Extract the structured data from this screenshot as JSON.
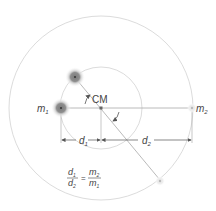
{
  "diagram": {
    "labels": {
      "m1": "m",
      "m1_sub": "1",
      "m2": "m",
      "m2_sub": "2",
      "cm": "CM",
      "d1": "d",
      "d1_sub": "1",
      "d2": "d",
      "d2_sub": "2"
    },
    "equation": {
      "lhs_num": "d",
      "lhs_num_sub": "1",
      "lhs_den": "d",
      "lhs_den_sub": "2",
      "equals": "=",
      "rhs_num": "m",
      "rhs_num_sub": "2",
      "rhs_den": "m",
      "rhs_den_sub": "1"
    },
    "colors": {
      "orbit": "#d8d8d8",
      "line": "#9a9a9a",
      "mass_fill": "#8a8a8a",
      "mass_glow": "#c9c9c9",
      "text": "#444444"
    }
  }
}
